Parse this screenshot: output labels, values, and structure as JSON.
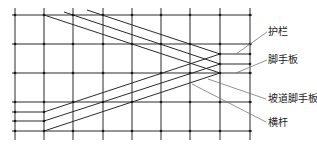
{
  "diagram": {
    "type": "scaffold-ramp-elevation",
    "colors": {
      "stroke": "#2a2a2a",
      "leader": "#777777",
      "node": "#1a1a1a",
      "text": "#222222"
    },
    "grid": {
      "vertical_x": [
        15,
        44,
        73,
        103,
        132,
        161,
        190,
        220,
        250
      ],
      "vertical_y_range": [
        8,
        140
      ],
      "horizontal_full": [
        {
          "y": 15,
          "x1": 12,
          "x2": 252
        },
        {
          "y": 44,
          "x1": 12,
          "x2": 252
        },
        {
          "y": 73,
          "x1": 12,
          "x2": 252
        },
        {
          "y": 102,
          "x1": 12,
          "x2": 252
        },
        {
          "y": 131,
          "x1": 12,
          "x2": 252
        }
      ],
      "horizontal_partial": [
        {
          "y": 112,
          "x1": 12,
          "x2": 44
        },
        {
          "y": 121,
          "x1": 12,
          "x2": 44
        },
        {
          "y": 54,
          "x1": 220,
          "x2": 250
        },
        {
          "y": 64,
          "x1": 220,
          "x2": 250
        }
      ]
    },
    "descending_ramps": [
      {
        "x1": 44,
        "y1": 15,
        "x2": 220,
        "y2": 73
      },
      {
        "x1": 64,
        "y1": 12,
        "x2": 220,
        "y2": 64
      },
      {
        "x1": 87,
        "y1": 10,
        "x2": 220,
        "y2": 54
      }
    ],
    "ascending_ramps": [
      {
        "x1": 44,
        "y1": 112,
        "x2": 220,
        "y2": 54
      },
      {
        "x1": 44,
        "y1": 121,
        "x2": 220,
        "y2": 64
      },
      {
        "x1": 44,
        "y1": 131,
        "x2": 220,
        "y2": 73
      }
    ],
    "labels": [
      {
        "text": "护栏",
        "x": 268,
        "y": 26,
        "leader": {
          "x1": 236,
          "y1": 54,
          "x2": 267,
          "y2": 32
        }
      },
      {
        "text": "脚手板",
        "x": 268,
        "y": 54,
        "leader": {
          "x1": 236,
          "y1": 73,
          "x2": 267,
          "y2": 60
        }
      },
      {
        "text": "坡道脚手板",
        "x": 268,
        "y": 93,
        "leader": {
          "x1": 208,
          "y1": 79,
          "x2": 266,
          "y2": 99
        }
      },
      {
        "text": "横杆",
        "x": 268,
        "y": 117,
        "leader": {
          "x1": 192,
          "y1": 84,
          "x2": 266,
          "y2": 122
        }
      }
    ]
  }
}
